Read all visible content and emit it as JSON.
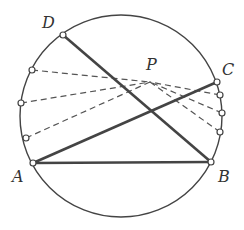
{
  "diagram": {
    "type": "geometry",
    "colors": {
      "stroke": "#444444",
      "dashed": "#555555",
      "text": "#333333",
      "background": "#ffffff"
    },
    "circle": {
      "cx": 121,
      "cy": 116,
      "r": 101
    },
    "points": {
      "A": {
        "label": "A",
        "x": 33,
        "y": 163,
        "lx": 12,
        "ly": 182
      },
      "B": {
        "label": "B",
        "x": 211,
        "y": 162,
        "lx": 218,
        "ly": 182
      },
      "C": {
        "label": "C",
        "x": 217,
        "y": 82,
        "lx": 222,
        "ly": 75
      },
      "D": {
        "label": "D",
        "x": 63,
        "y": 35,
        "lx": 42,
        "ly": 28
      },
      "P": {
        "label": "P",
        "x": 150,
        "y": 82,
        "lx": 146,
        "ly": 70
      }
    },
    "solid_segments": [
      [
        "A",
        "B"
      ],
      [
        "A",
        "C"
      ],
      [
        "D",
        "B"
      ]
    ],
    "dashed_left_points": [
      {
        "x": 32,
        "y": 70
      },
      {
        "x": 21,
        "y": 103
      },
      {
        "x": 26,
        "y": 138
      }
    ],
    "dashed_right_points": [
      {
        "x": 220,
        "y": 95
      },
      {
        "x": 222,
        "y": 113
      },
      {
        "x": 220,
        "y": 132
      }
    ]
  }
}
